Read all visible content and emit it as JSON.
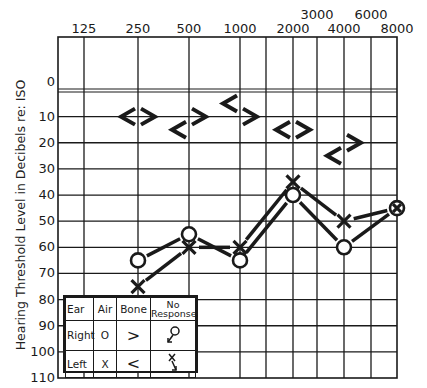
{
  "chart_data": {
    "type": "line",
    "xlabel": "Frequency (Hz)",
    "ylabel": "Hearing Threshold Level in Decibels re: ISO",
    "x_tick_labels_top_row": [
      "125",
      "250",
      "500",
      "1000",
      "2000",
      "4000",
      "8000"
    ],
    "x_tick_labels_upper_row": [
      "3000",
      "6000"
    ],
    "y_ticks": [
      0,
      10,
      20,
      30,
      40,
      50,
      60,
      70,
      80,
      90,
      100,
      110
    ],
    "ylim": [
      0,
      110
    ],
    "y_inverted": true,
    "grid": true,
    "series": [
      {
        "name": "Right Air (O)",
        "symbol": "O",
        "x": [
          250,
          500,
          1000,
          2000,
          4000,
          8000
        ],
        "values": [
          65,
          55,
          65,
          40,
          60,
          45
        ]
      },
      {
        "name": "Left Air (X)",
        "symbol": "X",
        "x": [
          250,
          500,
          1000,
          2000,
          4000,
          8000
        ],
        "values": [
          75,
          60,
          60,
          35,
          50,
          45
        ]
      },
      {
        "name": "Right Bone (>)",
        "symbol": ">",
        "x": [
          250,
          500,
          1000,
          2000,
          4000
        ],
        "values": [
          10,
          10,
          10,
          15,
          20
        ]
      },
      {
        "name": "Left Bone (<)",
        "symbol": "<",
        "x": [
          250,
          500,
          1000,
          2000,
          4000
        ],
        "values": [
          10,
          15,
          5,
          15,
          25
        ]
      }
    ],
    "legend": {
      "position": "lower-left",
      "headers": [
        "Ear",
        "Air",
        "Bone",
        "No Response"
      ],
      "rows": [
        {
          "ear": "Right",
          "air": "O",
          "bone": ">",
          "no_response": "O↙"
        },
        {
          "ear": "Left",
          "air": "X",
          "bone": "<",
          "no_response": "X↘"
        }
      ]
    }
  },
  "axis": {
    "ylabel": "Hearing Threshold Level in Decibels re: ISO"
  },
  "legend": {
    "h_ear": "Ear",
    "h_air": "Air",
    "h_bone": "Bone",
    "h_noresp_1": "No",
    "h_noresp_2": "Response",
    "right_label": "Right",
    "right_air": "O",
    "right_bone": ">",
    "left_label": "Left",
    "left_air": "X",
    "left_bone": "<"
  }
}
